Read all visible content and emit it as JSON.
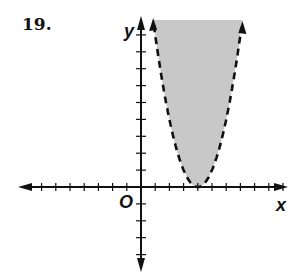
{
  "problem": {
    "number": "19."
  },
  "chart_data": {
    "type": "area",
    "title": "",
    "inequality": "y > (x - 4)^2",
    "boundary": {
      "function": "(x-4)^2",
      "style": "dashed",
      "vertex": [
        4,
        0
      ]
    },
    "shaded_region": "inside/above parabola",
    "xlabel": "x",
    "ylabel": "y",
    "origin_label": "O",
    "xlim": [
      -7,
      10
    ],
    "ylim": [
      -5,
      10
    ],
    "grid": false,
    "x_ticks": [
      -7,
      -6,
      -5,
      -4,
      -3,
      -2,
      -1,
      1,
      2,
      3,
      4,
      5,
      6,
      7,
      8,
      9,
      10
    ],
    "y_ticks": [
      -4,
      -3,
      -2,
      -1,
      1,
      2,
      3,
      4,
      5,
      6,
      7,
      8,
      9
    ],
    "x": [
      1,
      1.5,
      2,
      2.5,
      3,
      3.5,
      4,
      4.5,
      5,
      5.5,
      6,
      6.5,
      7
    ],
    "values": [
      9,
      6.25,
      4,
      2.25,
      1,
      0.25,
      0,
      0.25,
      1,
      2.25,
      4,
      6.25,
      9
    ],
    "colors": {
      "fill": "#c8c8c8",
      "line": "#111111",
      "axes": "#111111"
    }
  },
  "labels": {
    "x_axis": "x",
    "y_axis": "y",
    "origin": "O"
  }
}
